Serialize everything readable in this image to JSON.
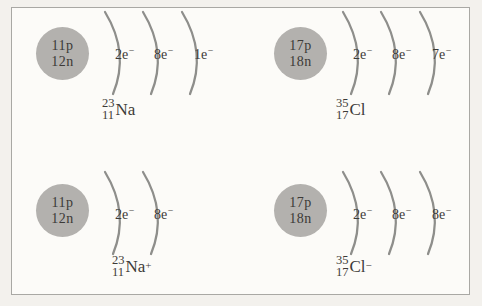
{
  "colors": {
    "background": "#f3f1ed",
    "panel": "#fcfbf8",
    "frame_border": "#a9a8a4",
    "nucleus_fill": "#b3b1ae",
    "shell_stroke": "#8e8e8b",
    "text": "#3c3a37"
  },
  "atoms": [
    {
      "nucleus": {
        "protons": "11p",
        "neutrons": "12n"
      },
      "shells": [
        {
          "count": "2e",
          "sign": "−"
        },
        {
          "count": "8e",
          "sign": "−"
        },
        {
          "count": "1e",
          "sign": "−"
        }
      ],
      "isotope": {
        "mass": "23",
        "atomic_number": "11",
        "symbol": "Na",
        "charge": ""
      }
    },
    {
      "nucleus": {
        "protons": "17p",
        "neutrons": "18n"
      },
      "shells": [
        {
          "count": "2e",
          "sign": "−"
        },
        {
          "count": "8e",
          "sign": "−"
        },
        {
          "count": "7e",
          "sign": "−"
        }
      ],
      "isotope": {
        "mass": "35",
        "atomic_number": "17",
        "symbol": "Cl",
        "charge": ""
      }
    },
    {
      "nucleus": {
        "protons": "11p",
        "neutrons": "12n"
      },
      "shells": [
        {
          "count": "2e",
          "sign": "−"
        },
        {
          "count": "8e",
          "sign": "−"
        }
      ],
      "isotope": {
        "mass": "23",
        "atomic_number": "11",
        "symbol": "Na",
        "charge": "+"
      }
    },
    {
      "nucleus": {
        "protons": "17p",
        "neutrons": "18n"
      },
      "shells": [
        {
          "count": "2e",
          "sign": "−"
        },
        {
          "count": "8e",
          "sign": "−"
        },
        {
          "count": "8e",
          "sign": "−"
        }
      ],
      "isotope": {
        "mass": "35",
        "atomic_number": "17",
        "symbol": "Cl",
        "charge": "−"
      }
    }
  ]
}
